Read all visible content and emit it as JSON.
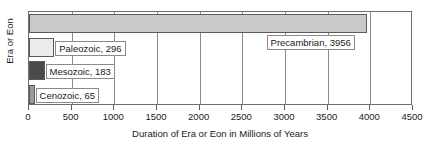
{
  "chart_data": {
    "type": "bar",
    "orientation": "horizontal",
    "title": "",
    "xlabel": "Duration of Era or Eon in Millions of Years",
    "ylabel": "Era or Eon",
    "categories": [
      "Precambrian",
      "Paleozoic",
      "Mesozoic",
      "Cenozoic"
    ],
    "values": [
      3956,
      296,
      183,
      65
    ],
    "data_labels": [
      "Precambrian, 3956",
      "Paleozoic, 296",
      "Mesozoic, 183",
      "Cenozoic, 65"
    ],
    "bar_colors": [
      "#c9c9c9",
      "#ececec",
      "#4a4a4a",
      "#9a9a9a"
    ],
    "bar_border_color": "#5a5a5a",
    "xlim": [
      0,
      4500
    ],
    "xticks": [
      0,
      500,
      1000,
      1500,
      2000,
      2500,
      3000,
      3500,
      4000,
      4500
    ],
    "xtick_labels": [
      "0",
      "500",
      "1000",
      "1500",
      "2000",
      "2500",
      "3000",
      "3500",
      "4000",
      "4500"
    ],
    "grid": true,
    "grid_axis": "x",
    "legend": false
  }
}
